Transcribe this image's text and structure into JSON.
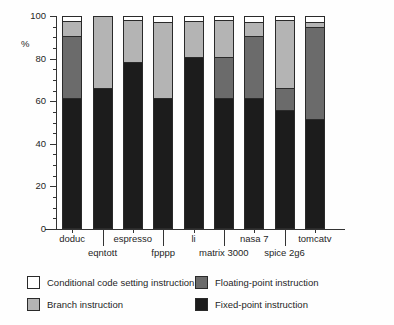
{
  "chart_data": {
    "type": "bar",
    "subtype": "stacked-bar-100-percent",
    "title": "",
    "xlabel": "",
    "ylabel": "%",
    "ylim": [
      0,
      100
    ],
    "ytick_labels": [
      "0",
      "20",
      "40",
      "60",
      "80",
      "100"
    ],
    "ytick_values": [
      0,
      20,
      40,
      60,
      80,
      100
    ],
    "yminor_step": 5,
    "grid": false,
    "legend_position": "below-plot",
    "categories": [
      "doduc",
      "eqntott",
      "espresso",
      "fpppp",
      "li",
      "matrix 3000",
      "nasa 7",
      "spice 2g6",
      "tomcatv"
    ],
    "series": [
      {
        "name": "Fixed-point instruction",
        "color": "#1c1c1c",
        "values": [
          61,
          66,
          78,
          61,
          80.5,
          61,
          61,
          55.5,
          51
        ]
      },
      {
        "name": "Floating-point instruction",
        "color": "#6b6b6b",
        "values": [
          29.5,
          0,
          0,
          0,
          0,
          19.5,
          29.5,
          10.5,
          44
        ]
      },
      {
        "name": "Branch instruction",
        "color": "#b4b4b4",
        "values": [
          7,
          34,
          20,
          36,
          17,
          17.5,
          6.5,
          32,
          2
        ]
      },
      {
        "name": "Conditional code setting instruction",
        "color": "#ffffff",
        "values": [
          2.5,
          0,
          2,
          3,
          2.5,
          2,
          3,
          2,
          3
        ]
      }
    ]
  },
  "axis": {
    "y_label": "%",
    "ticks": [
      {
        "label": "100",
        "value": 100
      },
      {
        "label": "80",
        "value": 80
      },
      {
        "label": "60",
        "value": 60
      },
      {
        "label": "40",
        "value": 40
      },
      {
        "label": "20",
        "value": 20
      },
      {
        "label": "0",
        "value": 0
      }
    ]
  },
  "x_labels_row1": [
    "doduc",
    "espresso",
    "li",
    "nasa 7",
    "tomcatv"
  ],
  "x_labels_row2": [
    "eqntott",
    "fpppp",
    "matrix 3000",
    "spice 2g6"
  ],
  "legend": {
    "items": [
      {
        "label": "Conditional code setting instruction",
        "swatch": "sw-cc"
      },
      {
        "label": "Floating-point instruction",
        "swatch": "sw-fp"
      },
      {
        "label": "Branch instruction",
        "swatch": "sw-branch"
      },
      {
        "label": "Fixed-point instruction",
        "swatch": "sw-fixed"
      }
    ]
  }
}
